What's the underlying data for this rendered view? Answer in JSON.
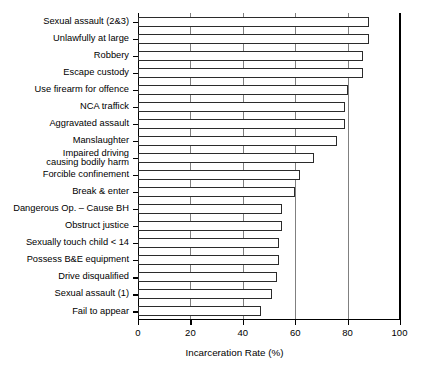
{
  "chart_data": {
    "type": "bar",
    "orientation": "horizontal",
    "title": "",
    "xlabel": "Incarceration Rate (%)",
    "ylabel": "",
    "xlim": [
      0,
      100
    ],
    "xticks": [
      0,
      20,
      40,
      60,
      80,
      100
    ],
    "grid": "vertical",
    "legend": "none",
    "categories": [
      "Sexual assault (2&3)",
      "Unlawfully at large",
      "Robbery",
      "Escape custody",
      "Use firearm for offence",
      "NCA traffick",
      "Aggravated assault",
      "Manslaughter",
      "Impaired driving\ncausing bodily harm",
      "Forcible confinement",
      "Break & enter",
      "Dangerous Op. – Cause BH",
      "Obstruct justice",
      "Sexually touch child < 14",
      "Possess B&E equipment",
      "Drive disqualified",
      "Sexual assault (1)",
      "Fail to appear"
    ],
    "values": [
      88,
      88,
      86,
      86,
      80,
      79,
      79,
      76,
      67,
      62,
      60,
      55,
      55,
      54,
      54,
      53,
      51,
      47
    ]
  },
  "axis": {
    "x_tick_labels": [
      "0",
      "20",
      "40",
      "60",
      "80",
      "100"
    ],
    "x_axis_title": "Incarceration Rate (%)"
  }
}
